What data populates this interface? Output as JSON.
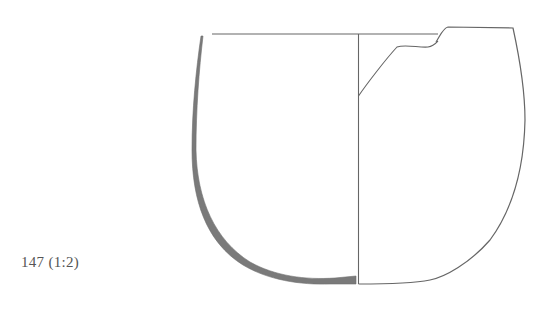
{
  "figure": {
    "caption": "147 (1:2)",
    "catalog_number": "147",
    "scale": "1:2",
    "colors": {
      "line": "#666666",
      "section_fill": "#7a7a7a",
      "text": "#555555",
      "background": "#ffffff"
    },
    "parts": [
      "rim-line",
      "center-axis",
      "section-profile",
      "exterior-outline",
      "interior-break-line"
    ]
  }
}
